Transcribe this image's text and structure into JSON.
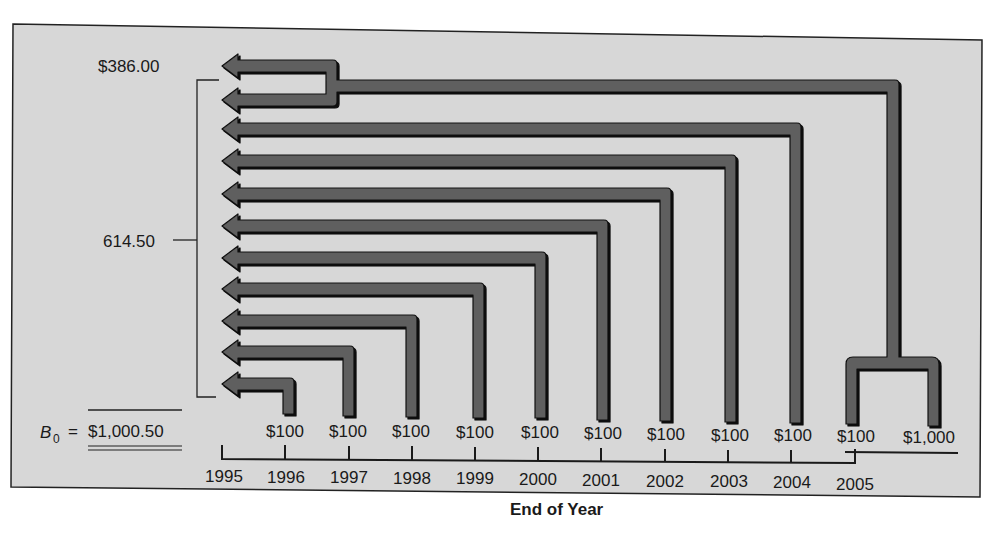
{
  "figure": {
    "bg_color": "#d7d7d7",
    "arrow_fill": "#5e5e5e",
    "arrow_stroke": "#111111",
    "labels": {
      "top_value": "$386.00",
      "bracket_value": "614.50",
      "bond_value_symbol": "B",
      "bond_value_subscript": "0",
      "bond_value_equals": "=",
      "bond_value": "$1,000.50",
      "axis_title": "End of Year"
    },
    "timeline": {
      "years": [
        "1995",
        "1996",
        "1997",
        "1998",
        "1999",
        "2000",
        "2001",
        "2002",
        "2003",
        "2004",
        "2005"
      ],
      "cash_flows": [
        {
          "year": "1996",
          "label": "$100"
        },
        {
          "year": "1997",
          "label": "$100"
        },
        {
          "year": "1998",
          "label": "$100"
        },
        {
          "year": "1999",
          "label": "$100"
        },
        {
          "year": "2000",
          "label": "$100"
        },
        {
          "year": "2001",
          "label": "$100"
        },
        {
          "year": "2002",
          "label": "$100"
        },
        {
          "year": "2003",
          "label": "$100"
        },
        {
          "year": "2004",
          "label": "$100"
        },
        {
          "year": "2005",
          "label": "$100"
        },
        {
          "year": "2005",
          "label": "$1,000"
        }
      ]
    }
  }
}
